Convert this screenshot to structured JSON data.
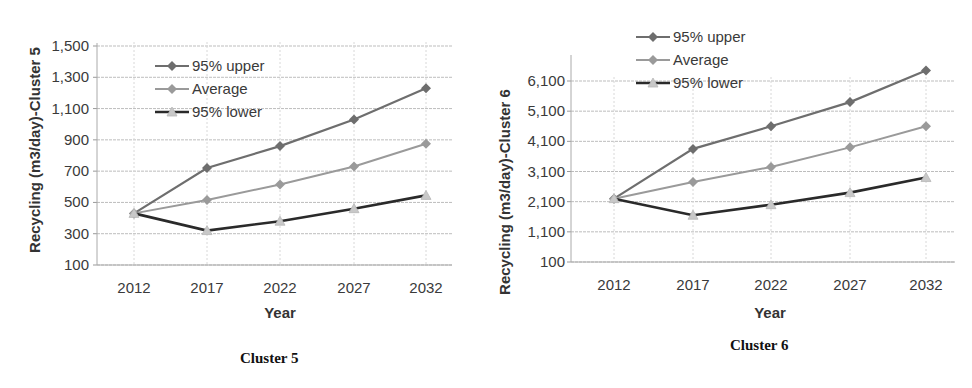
{
  "chart_data": [
    {
      "type": "line",
      "title": "Cluster 5",
      "xlabel": "Year",
      "ylabel": "Recycling  (m3/day)-Cluster 5",
      "categories": [
        "2012",
        "2017",
        "2022",
        "2027",
        "2032"
      ],
      "y_ticks": [
        "1,500",
        "1,300",
        "1,100",
        "900",
        "700",
        "500",
        "300",
        "100"
      ],
      "ylim": [
        100,
        1500
      ],
      "grid": true,
      "legend_position": "upper-left-inside",
      "series": [
        {
          "name": "95% upper",
          "marker": "diamond",
          "color": "#6e6e6e",
          "values": [
            430,
            720,
            860,
            1030,
            1230
          ]
        },
        {
          "name": "Average",
          "marker": "diamond",
          "color": "#9a9a9a",
          "values": [
            430,
            515,
            615,
            730,
            875
          ]
        },
        {
          "name": "95% lower",
          "marker": "triangle",
          "color": "#2a2a2a",
          "values": [
            430,
            320,
            380,
            460,
            545
          ]
        }
      ]
    },
    {
      "type": "line",
      "title": "Cluster 6",
      "xlabel": "Year",
      "ylabel": "Recycling (m3/day)-Cluster 6",
      "categories": [
        "2012",
        "2017",
        "2022",
        "2027",
        "2032"
      ],
      "y_ticks": [
        "6,100",
        "5,100",
        "4,100",
        "3,100",
        "2,100",
        "1,100",
        "100"
      ],
      "ylim": [
        100,
        6600
      ],
      "grid": true,
      "legend_position": "top-left-above",
      "series": [
        {
          "name": "95% upper",
          "marker": "diamond",
          "color": "#6e6e6e",
          "values": [
            2200,
            3850,
            4600,
            5400,
            6450
          ]
        },
        {
          "name": "Average",
          "marker": "diamond",
          "color": "#9a9a9a",
          "values": [
            2200,
            2750,
            3250,
            3900,
            4600
          ]
        },
        {
          "name": "95% lower",
          "marker": "triangle",
          "color": "#2a2a2a",
          "values": [
            2200,
            1650,
            2000,
            2400,
            2900
          ]
        }
      ]
    }
  ],
  "captions": {
    "left": "Cluster 5",
    "right": "Cluster 6"
  }
}
